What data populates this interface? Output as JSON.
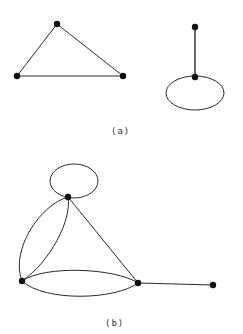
{
  "figure_a": {
    "caption": "(a)",
    "graphs": [
      {
        "name": "triangle",
        "vertices": [
          {
            "id": "a1",
            "x": 57,
            "y": 24
          },
          {
            "id": "a2",
            "x": 17,
            "y": 76
          },
          {
            "id": "a3",
            "x": 123,
            "y": 76
          }
        ],
        "edges": [
          [
            "a1",
            "a2"
          ],
          [
            "a1",
            "a3"
          ],
          [
            "a2",
            "a3"
          ]
        ]
      },
      {
        "name": "pendant-with-loop",
        "vertices": [
          {
            "id": "a4",
            "x": 195,
            "y": 27
          },
          {
            "id": "a5",
            "x": 195,
            "y": 77
          }
        ],
        "edges": [
          [
            "a4",
            "a5"
          ]
        ],
        "loops": [
          {
            "vertex": "a5",
            "cx": 195,
            "cy": 93,
            "rx": 29,
            "ry": 17
          }
        ]
      }
    ]
  },
  "figure_b": {
    "caption": "(b)",
    "vertices": [
      {
        "id": "b1",
        "x": 68,
        "y": 197
      },
      {
        "id": "b2",
        "x": 22,
        "y": 281
      },
      {
        "id": "b3",
        "x": 138,
        "y": 283
      },
      {
        "id": "b4",
        "x": 213,
        "y": 285
      }
    ],
    "edges": [
      {
        "from": "b1",
        "to": "b2",
        "type": "multi-edge-outer"
      },
      {
        "from": "b1",
        "to": "b2",
        "type": "multi-edge-inner"
      },
      {
        "from": "b1",
        "to": "b3",
        "type": "straight"
      },
      {
        "from": "b2",
        "to": "b3",
        "type": "multi-edge-upper"
      },
      {
        "from": "b2",
        "to": "b3",
        "type": "multi-edge-lower"
      },
      {
        "from": "b3",
        "to": "b4",
        "type": "straight"
      }
    ],
    "loops": [
      {
        "vertex": "b1",
        "cx": 74,
        "cy": 181,
        "rx": 24,
        "ry": 17
      }
    ]
  }
}
